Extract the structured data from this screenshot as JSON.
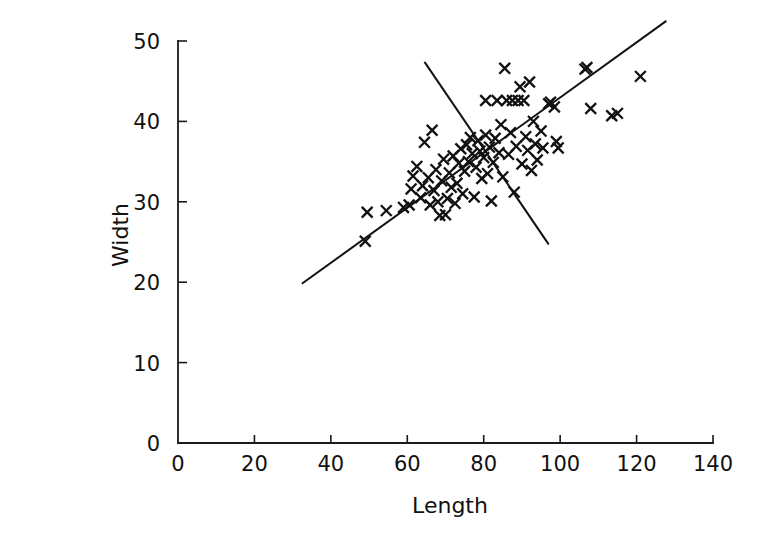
{
  "chart_data": {
    "type": "scatter",
    "title": "",
    "xlabel": "Length",
    "ylabel": "Width",
    "xlim": [
      0,
      140
    ],
    "ylim": [
      0,
      50
    ],
    "xticks": [
      0,
      20,
      40,
      60,
      80,
      100,
      120,
      140
    ],
    "yticks": [
      0,
      10,
      20,
      30,
      40,
      50
    ],
    "xtick_labels": [
      "0",
      "20",
      "40",
      "60",
      "80",
      "100",
      "120",
      "140"
    ],
    "ytick_labels": [
      "0",
      "10",
      "20",
      "30",
      "40",
      "50"
    ],
    "grid": false,
    "legend": null,
    "marker": "x",
    "marker_color": "#111111",
    "points": [
      {
        "x": 49.0,
        "y": 25.1
      },
      {
        "x": 49.5,
        "y": 28.7
      },
      {
        "x": 54.5,
        "y": 28.9
      },
      {
        "x": 59.0,
        "y": 29.3
      },
      {
        "x": 60.5,
        "y": 29.6
      },
      {
        "x": 61.0,
        "y": 31.6
      },
      {
        "x": 61.5,
        "y": 33.2
      },
      {
        "x": 62.5,
        "y": 34.4
      },
      {
        "x": 63.5,
        "y": 30.5
      },
      {
        "x": 64.0,
        "y": 32.0
      },
      {
        "x": 64.5,
        "y": 37.4
      },
      {
        "x": 65.5,
        "y": 33.0
      },
      {
        "x": 66.0,
        "y": 29.6
      },
      {
        "x": 66.5,
        "y": 38.9
      },
      {
        "x": 67.0,
        "y": 31.4
      },
      {
        "x": 67.5,
        "y": 34.0
      },
      {
        "x": 68.0,
        "y": 30.0
      },
      {
        "x": 68.5,
        "y": 28.3
      },
      {
        "x": 69.0,
        "y": 32.6
      },
      {
        "x": 69.5,
        "y": 35.3
      },
      {
        "x": 70.0,
        "y": 28.4
      },
      {
        "x": 70.5,
        "y": 30.4
      },
      {
        "x": 71.0,
        "y": 33.6
      },
      {
        "x": 71.5,
        "y": 31.8
      },
      {
        "x": 72.0,
        "y": 35.7
      },
      {
        "x": 72.5,
        "y": 29.8
      },
      {
        "x": 73.0,
        "y": 32.3
      },
      {
        "x": 73.5,
        "y": 34.8
      },
      {
        "x": 74.0,
        "y": 36.6
      },
      {
        "x": 74.5,
        "y": 31.0
      },
      {
        "x": 75.0,
        "y": 33.8
      },
      {
        "x": 75.5,
        "y": 37.1
      },
      {
        "x": 76.0,
        "y": 35.0
      },
      {
        "x": 76.5,
        "y": 38.0
      },
      {
        "x": 77.0,
        "y": 36.0
      },
      {
        "x": 77.5,
        "y": 30.6
      },
      {
        "x": 78.0,
        "y": 34.3
      },
      {
        "x": 78.5,
        "y": 37.6
      },
      {
        "x": 79.0,
        "y": 36.3
      },
      {
        "x": 79.5,
        "y": 32.9
      },
      {
        "x": 80.0,
        "y": 35.5
      },
      {
        "x": 80.5,
        "y": 38.3
      },
      {
        "x": 80.5,
        "y": 42.6
      },
      {
        "x": 81.0,
        "y": 33.5
      },
      {
        "x": 81.5,
        "y": 36.8
      },
      {
        "x": 82.0,
        "y": 30.1
      },
      {
        "x": 82.5,
        "y": 34.9
      },
      {
        "x": 83.0,
        "y": 37.9
      },
      {
        "x": 83.5,
        "y": 42.6
      },
      {
        "x": 84.0,
        "y": 36.1
      },
      {
        "x": 84.5,
        "y": 39.6
      },
      {
        "x": 85.0,
        "y": 33.1
      },
      {
        "x": 85.5,
        "y": 46.6
      },
      {
        "x": 86.0,
        "y": 42.6
      },
      {
        "x": 86.5,
        "y": 35.9
      },
      {
        "x": 87.0,
        "y": 38.6
      },
      {
        "x": 87.5,
        "y": 42.6
      },
      {
        "x": 88.0,
        "y": 31.2
      },
      {
        "x": 88.5,
        "y": 36.9
      },
      {
        "x": 89.0,
        "y": 42.6
      },
      {
        "x": 89.5,
        "y": 44.3
      },
      {
        "x": 90.0,
        "y": 34.7
      },
      {
        "x": 90.5,
        "y": 42.6
      },
      {
        "x": 91.0,
        "y": 38.1
      },
      {
        "x": 91.5,
        "y": 36.4
      },
      {
        "x": 92.0,
        "y": 44.9
      },
      {
        "x": 92.5,
        "y": 33.9
      },
      {
        "x": 93.0,
        "y": 40.0
      },
      {
        "x": 93.5,
        "y": 37.2
      },
      {
        "x": 94.0,
        "y": 35.2
      },
      {
        "x": 95.0,
        "y": 38.8
      },
      {
        "x": 95.5,
        "y": 36.7
      },
      {
        "x": 97.0,
        "y": 42.2
      },
      {
        "x": 97.5,
        "y": 42.4
      },
      {
        "x": 98.5,
        "y": 41.8
      },
      {
        "x": 99.0,
        "y": 37.5
      },
      {
        "x": 99.5,
        "y": 36.7
      },
      {
        "x": 106.5,
        "y": 46.5
      },
      {
        "x": 107.0,
        "y": 46.7
      },
      {
        "x": 108.0,
        "y": 41.6
      },
      {
        "x": 113.5,
        "y": 40.7
      },
      {
        "x": 115.0,
        "y": 41.0
      },
      {
        "x": 121.0,
        "y": 45.6
      }
    ],
    "lines": [
      {
        "name": "regression-width-on-length",
        "direction": "ascending",
        "x_start": 32.4,
        "y_start": 19.8,
        "x_end": 127.8,
        "y_end": 52.5
      },
      {
        "name": "regression-length-on-width",
        "direction": "descending",
        "x_start": 64.5,
        "y_start": 47.4,
        "x_end": 97.0,
        "y_end": 24.7
      }
    ]
  },
  "axes": {
    "x_title": "Length",
    "y_title": "Width"
  }
}
